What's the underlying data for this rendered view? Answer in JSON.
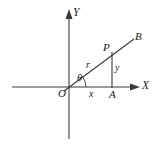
{
  "figure": {
    "stroke_color": "#333333",
    "background_color": "#ffffff",
    "axes": {
      "x_label": "X",
      "y_label": "Y",
      "origin_label": "O"
    },
    "points": [
      {
        "name": "origin",
        "label": "O",
        "x": 69,
        "y": 87
      },
      {
        "name": "point-p",
        "label": "P",
        "x": 112,
        "y": 52
      },
      {
        "name": "point-a",
        "label": "A",
        "x": 112,
        "y": 87
      },
      {
        "name": "ray-end-b",
        "label": "B",
        "x": 133,
        "y": 40
      }
    ],
    "segments": [
      {
        "name": "hypotenuse",
        "label": "r"
      },
      {
        "name": "adjacent-leg",
        "label": "x"
      },
      {
        "name": "opposite-leg",
        "label": "y"
      }
    ],
    "angle": {
      "name": "angle-theta",
      "label": "θ"
    }
  }
}
